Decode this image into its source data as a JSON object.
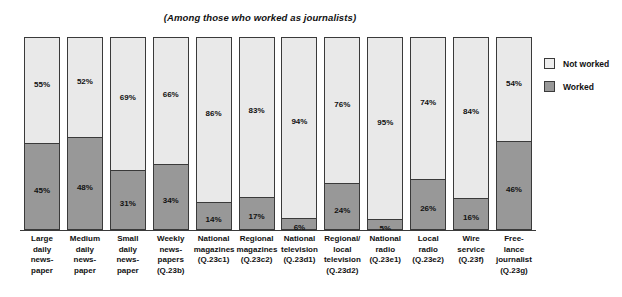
{
  "chart_data": {
    "type": "bar",
    "subtype": "stacked-100-percent",
    "title": "(Among those who worked as journalists)",
    "xlabel": "",
    "ylabel": "",
    "ylim": [
      0,
      100
    ],
    "grid": false,
    "legend_position": "right",
    "categories": [
      "Large daily newspaper",
      "Medium daily newspaper",
      "Small daily newspaper",
      "Weekly newspapers (Q.23b)",
      "National magazines (Q.23c1)",
      "Regional magazines (Q.23c2)",
      "National television (Q.23d1)",
      "Regional/local television (Q.23d2)",
      "National radio (Q.23e1)",
      "Local radio (Q.23e2)",
      "Wire service (Q.23f)",
      "Free-lance journalist (Q.23g)"
    ],
    "category_lines": [
      [
        "Large",
        "daily",
        "news-",
        "paper"
      ],
      [
        "Medium",
        "daily",
        "news-",
        "paper"
      ],
      [
        "Small",
        "daily",
        "news-",
        "paper"
      ],
      [
        "Weekly",
        "news-",
        "papers",
        "(Q.23b)"
      ],
      [
        "National",
        "magazines",
        "(Q.23c1)"
      ],
      [
        "Regional",
        "magazines",
        "(Q.23c2)"
      ],
      [
        "National",
        "television",
        "(Q.23d1)"
      ],
      [
        "Regional/",
        "local",
        "television",
        "(Q.23d2)"
      ],
      [
        "National",
        "radio",
        "(Q.23e1)"
      ],
      [
        "Local",
        "radio",
        "(Q.23e2)"
      ],
      [
        "Wire",
        "service",
        "(Q.23f)"
      ],
      [
        "Free-",
        "lance",
        "journalist",
        "(Q.23g)"
      ]
    ],
    "series": [
      {
        "name": "Not worked",
        "color": "#e9e9e9",
        "values": [
          55,
          52,
          69,
          66,
          86,
          83,
          94,
          76,
          95,
          74,
          84,
          54
        ],
        "labels": [
          "55%",
          "52%",
          "69%",
          "66%",
          "86%",
          "83%",
          "94%",
          "76%",
          "95%",
          "74%",
          "84%",
          "54%"
        ]
      },
      {
        "name": "Worked",
        "color": "#989898",
        "values": [
          45,
          48,
          31,
          34,
          14,
          17,
          6,
          24,
          5,
          26,
          16,
          46
        ],
        "labels": [
          "45%",
          "48%",
          "31%",
          "34%",
          "14%",
          "17%",
          "6%",
          "24%",
          "5%",
          "26%",
          "16%",
          "46%"
        ]
      }
    ]
  },
  "legend": {
    "items": [
      {
        "label": "Not worked",
        "swatch_class": "sw-notworked"
      },
      {
        "label": "Worked",
        "swatch_class": "sw-worked"
      }
    ]
  }
}
